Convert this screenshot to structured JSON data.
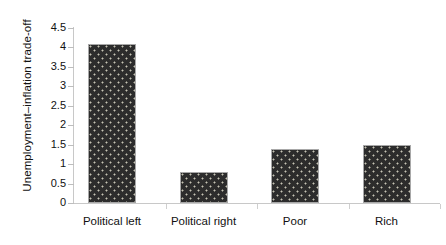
{
  "chart_data": {
    "type": "bar",
    "title": "",
    "subtitle": "",
    "xlabel": "",
    "ylabel": "Unemployment–inflation trade-off",
    "categories": [
      "Political left",
      "Political right",
      "Poor",
      "Rich"
    ],
    "values": [
      4.1,
      0.8,
      1.4,
      1.5
    ],
    "series": [
      {
        "name": "Unemployment-inflation trade-off",
        "values": [
          4.1,
          0.8,
          1.4,
          1.5
        ]
      }
    ],
    "ylim": [
      0,
      4.5
    ],
    "ytick_labels": [
      "0",
      "0.5",
      "1",
      "1.5",
      "2",
      "2.5",
      "3",
      "3.5",
      "4",
      "4.5"
    ],
    "ytick_values": [
      0,
      0.5,
      1,
      1.5,
      2,
      2.5,
      3,
      3.5,
      4,
      4.5
    ],
    "grid": false,
    "legend": false,
    "legend_position": "none",
    "annotations": [],
    "colors": {
      "bar_fill": "#2c2c2c",
      "bar_pattern_dots": "#e1decd",
      "bar_border": "#a8a8a8",
      "axis_line": "#c8c8c8",
      "tick_mark": "#bdbdbd",
      "text": "#111111",
      "background": "#ffffff"
    }
  }
}
